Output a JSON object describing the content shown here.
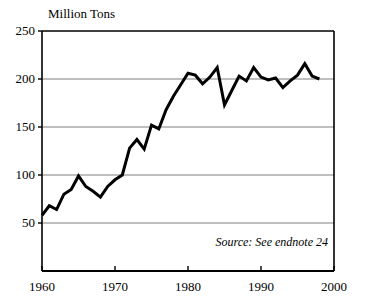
{
  "chart_data": {
    "type": "line",
    "title": "",
    "ylabel": "Million Tons",
    "xlabel": "",
    "xlim": [
      1960,
      2000
    ],
    "ylim": [
      0,
      250
    ],
    "grid": true,
    "legend": null,
    "y_ticks": [
      50,
      100,
      150,
      200,
      250
    ],
    "y_tick_labels": [
      "50",
      "100",
      "150",
      "200",
      "250"
    ],
    "x_ticks": [
      1960,
      1970,
      1980,
      1990,
      2000
    ],
    "x_tick_labels": [
      "1960",
      "1970",
      "1980",
      "1990",
      "2000"
    ],
    "annotations": [
      {
        "text": "Source: See endnote 24",
        "x": 1996,
        "y": 30,
        "style": "italic",
        "align": "right"
      }
    ],
    "series": [
      {
        "name": "Million Tons",
        "color": "#000000",
        "line_width": 3,
        "x": [
          1960,
          1961,
          1962,
          1963,
          1964,
          1965,
          1966,
          1967,
          1968,
          1969,
          1970,
          1971,
          1972,
          1973,
          1974,
          1975,
          1976,
          1977,
          1978,
          1979,
          1980,
          1981,
          1982,
          1983,
          1984,
          1985,
          1986,
          1987,
          1988,
          1989,
          1990,
          1991,
          1992,
          1993,
          1994,
          1995,
          1996,
          1997,
          1998
        ],
        "values": [
          58,
          68,
          64,
          80,
          85,
          99,
          88,
          83,
          77,
          88,
          95,
          100,
          128,
          137,
          127,
          152,
          148,
          168,
          182,
          194,
          206,
          204,
          195,
          202,
          212,
          173,
          188,
          203,
          198,
          212,
          202,
          199,
          201,
          191,
          198,
          204,
          216,
          203,
          200
        ]
      }
    ]
  },
  "figure": {
    "background_color": "#ffffff",
    "axis_color": "#000000",
    "grid_color": "#808080",
    "text_color": "#000000"
  }
}
